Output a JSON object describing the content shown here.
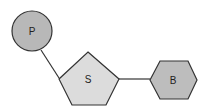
{
  "diagram": {
    "nodes": [
      {
        "id": "phosphate",
        "label": "P",
        "shape": "circle",
        "fill": "#b8b8b8"
      },
      {
        "id": "sugar",
        "label": "S",
        "shape": "pentagon",
        "fill": "#dcdcdc"
      },
      {
        "id": "base",
        "label": "B",
        "shape": "hexagon",
        "fill": "#bdbdbd"
      }
    ],
    "edges": [
      {
        "from": "phosphate",
        "to": "sugar"
      },
      {
        "from": "sugar",
        "to": "base"
      }
    ],
    "stroke": "#333333"
  }
}
